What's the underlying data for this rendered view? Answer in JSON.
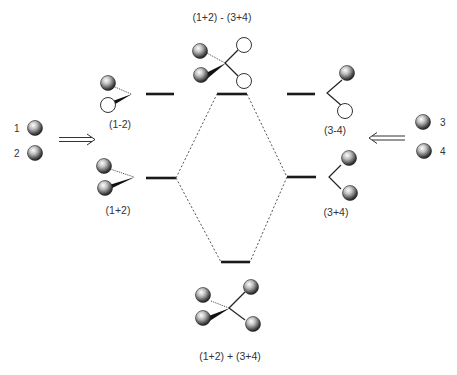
{
  "diagram": {
    "title_top": "(1+2)  -  (3+4)",
    "title_bottom": "(1+2)  +  (3+4)",
    "left_fragment": {
      "atom_labels": [
        "1",
        "2"
      ],
      "upper_orbital_label": "(1-2)",
      "lower_orbital_label": "(1+2)"
    },
    "right_fragment": {
      "atom_labels": [
        "3",
        "4"
      ],
      "upper_orbital_label": "(3-4)",
      "lower_orbital_label": "(3+4)"
    },
    "levels": [
      {
        "id": "left-upper",
        "label": "(1-2)"
      },
      {
        "id": "left-lower",
        "label": "(1+2)"
      },
      {
        "id": "center-upper",
        "label": "(1+2) - (3+4)"
      },
      {
        "id": "center-lower",
        "label": "(1+2) + (3+4)"
      },
      {
        "id": "right-upper",
        "label": "(3-4)"
      },
      {
        "id": "right-lower",
        "label": "(3+4)"
      }
    ],
    "icons": {
      "shaded_sphere": "filled-orbital-lobe",
      "open_circle": "empty-orbital-lobe",
      "double_arrow": "implies-arrow"
    },
    "colors": {
      "line": "#1a1a1a",
      "text": "#333333",
      "background": "#ffffff"
    }
  }
}
